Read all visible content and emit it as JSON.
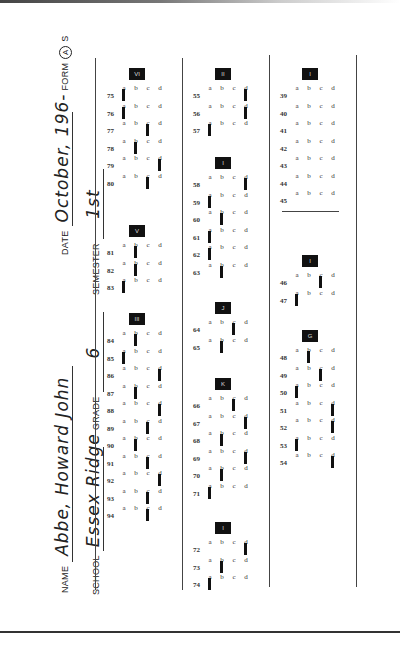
{
  "header": {
    "name_label": "NAME",
    "name_value": "Abbe, Howard John",
    "school_label": "SCHOOL",
    "school_value": "Essex Ridge",
    "grade_label": "GRADE",
    "grade_value": "6",
    "semester_label": "SEMESTER",
    "semester_value": "1st",
    "date_label": "DATE",
    "date_value": "October, 196-",
    "form_label": "FORM",
    "form_selected": "A",
    "form_other": "S"
  },
  "options": [
    "a",
    "b",
    "c",
    "d"
  ],
  "sections": [
    {
      "label": "VI",
      "x": 107,
      "y": 68,
      "questions": [
        {
          "n": "75",
          "ans": "a"
        },
        {
          "n": "76",
          "ans": "a"
        },
        {
          "n": "77",
          "ans": "c"
        },
        {
          "n": "78",
          "ans": "b"
        },
        {
          "n": "79",
          "ans": "d"
        },
        {
          "n": "80",
          "ans": "c"
        }
      ]
    },
    {
      "label": "V",
      "x": 107,
      "y": 225,
      "questions": [
        {
          "n": "81",
          "ans": "b"
        },
        {
          "n": "82",
          "ans": "b"
        },
        {
          "n": "83",
          "ans": "a"
        }
      ]
    },
    {
      "label": "III",
      "x": 107,
      "y": 313,
      "questions": [
        {
          "n": "84",
          "ans": "b"
        },
        {
          "n": "85",
          "ans": "a"
        },
        {
          "n": "86",
          "ans": "d"
        },
        {
          "n": "87",
          "ans": "b"
        },
        {
          "n": "88",
          "ans": "d"
        },
        {
          "n": "89",
          "ans": "c"
        },
        {
          "n": "90",
          "ans": "b"
        },
        {
          "n": "91",
          "ans": "c"
        },
        {
          "n": "92",
          "ans": "d"
        },
        {
          "n": "93",
          "ans": "c"
        },
        {
          "n": "94",
          "ans": "c"
        }
      ]
    },
    {
      "label": "II",
      "x": 193,
      "y": 68,
      "questions": [
        {
          "n": "55",
          "ans": "d"
        },
        {
          "n": "56",
          "ans": "d"
        },
        {
          "n": "57",
          "ans": "a"
        }
      ]
    },
    {
      "label": "I",
      "x": 193,
      "y": 157,
      "questions": [
        {
          "n": "58",
          "ans": "d"
        },
        {
          "n": "59",
          "ans": "a"
        },
        {
          "n": "60",
          "ans": "b"
        },
        {
          "n": "61",
          "ans": "a"
        },
        {
          "n": "62",
          "ans": "a"
        },
        {
          "n": "63",
          "ans": "b"
        }
      ]
    },
    {
      "label": "J",
      "x": 193,
      "y": 302,
      "questions": [
        {
          "n": "64",
          "ans": "c"
        },
        {
          "n": "65",
          "ans": "b"
        }
      ]
    },
    {
      "label": "K",
      "x": 193,
      "y": 378,
      "questions": [
        {
          "n": "66",
          "ans": "c"
        },
        {
          "n": "67",
          "ans": "d"
        },
        {
          "n": "68",
          "ans": "b"
        },
        {
          "n": "69",
          "ans": "d"
        },
        {
          "n": "70",
          "ans": "b"
        },
        {
          "n": "71",
          "ans": "a"
        }
      ]
    },
    {
      "label": "I",
      "x": 193,
      "y": 522,
      "questions": [
        {
          "n": "72",
          "ans": "d"
        },
        {
          "n": "73",
          "ans": "b"
        },
        {
          "n": "74",
          "ans": "a"
        }
      ]
    },
    {
      "label": "I",
      "x": 280,
      "y": 68,
      "questions": [
        {
          "n": "39",
          "ans": ""
        },
        {
          "n": "40",
          "ans": ""
        },
        {
          "n": "41",
          "ans": ""
        },
        {
          "n": "42",
          "ans": ""
        },
        {
          "n": "43",
          "ans": ""
        },
        {
          "n": "44",
          "ans": ""
        },
        {
          "n": "45",
          "ans": ""
        }
      ]
    },
    {
      "label": "I",
      "x": 280,
      "y": 255,
      "questions": [
        {
          "n": "46",
          "ans": "c"
        },
        {
          "n": "47",
          "ans": "a"
        }
      ]
    },
    {
      "label": "G",
      "x": 280,
      "y": 330,
      "questions": [
        {
          "n": "48",
          "ans": "b"
        },
        {
          "n": "49",
          "ans": "c"
        },
        {
          "n": "50",
          "ans": "a"
        },
        {
          "n": "51",
          "ans": "d"
        },
        {
          "n": "52",
          "ans": "d"
        },
        {
          "n": "53",
          "ans": "a"
        },
        {
          "n": "54",
          "ans": "d"
        }
      ]
    }
  ]
}
